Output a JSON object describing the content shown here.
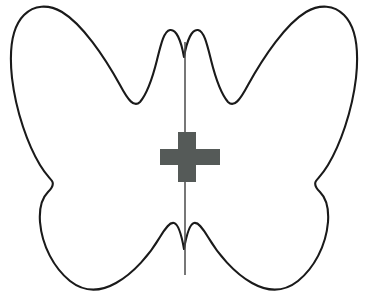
{
  "figure": {
    "title": "Butterfly outline with vertical line of symmetry and center cross mark",
    "canvas": {
      "width": 368,
      "height": 298,
      "background": "#ffffff"
    },
    "shapes": {
      "butterfly": {
        "name": "butterfly-outline",
        "description": "Closed symmetric butterfly silhouette, white fill with black outline",
        "fill": "#ffffff",
        "stroke": "#1a1a1a",
        "stroke_width": 2.1,
        "bounds": {
          "left": 10,
          "top": 7,
          "right": 358,
          "bottom": 290
        },
        "path": "M 184 57 C 181 40 176 29 170 30 C 164 31 161 44 157 60 C 152 80 146 95 140 102 C 134 108 128 100 120 85 C 104 56 82 24 62 12 C 48 4 34 5 24 15 C 12 27 9 50 12 78 C 16 112 28 145 40 165 C 46 175 50 178 52 181 C 54 184 52 188 48 192 C 42 198 39 208 40 222 C 42 246 54 268 70 281 C 84 292 100 292 116 283 C 134 273 150 254 160 237 C 166 227 170 222 174 223 C 178 224 181 232 184 249 C 187 232 190 224 194 223 C 198 222 202 227 208 237 C 218 254 234 273 252 283 C 268 292 284 292 298 281 C 314 268 326 246 328 222 C 329 208 326 198 320 192 C 316 188 314 184 316 181 C 318 178 322 175 328 165 C 340 145 352 112 356 78 C 359 50 356 27 344 15 C 334 5 320 4 306 12 C 286 24 264 56 248 85 C 240 100 234 108 228 102 C 222 95 216 80 211 60 C 207 44 204 31 198 30 C 192 29 187 40 184 57 Z"
      },
      "symmetry_axis": {
        "name": "symmetry-axis-line",
        "description": "Vertical line of symmetry drawn through the center of the butterfly",
        "orientation": "vertical",
        "stroke": "#4a4a4a",
        "stroke_width": 1.5,
        "x": 185,
        "y_start": 42,
        "y_end": 275
      },
      "cross": {
        "name": "center-cross-mark",
        "description": "Solid dark gray plus/cross symbol centered on the axis of symmetry",
        "fill": "#555a58",
        "center_x": 187,
        "center_y": 157,
        "arm_span_horizontal": 60,
        "arm_span_vertical": 50,
        "bar_thickness_vertical": 18,
        "bar_thickness_horizontal": 16,
        "bounds": {
          "left": 160,
          "top": 132,
          "right": 220,
          "bottom": 182
        },
        "path": "M 178 132 L 196 132 L 196 149 L 220 149 L 220 165 L 196 165 L 196 182 L 178 182 L 178 165 L 160 165 L 160 149 L 178 149 Z"
      }
    },
    "colors": {
      "background": "#ffffff",
      "outline_stroke": "#1a1a1a",
      "axis_stroke": "#4a4a4a",
      "cross_fill": "#555a58"
    }
  }
}
